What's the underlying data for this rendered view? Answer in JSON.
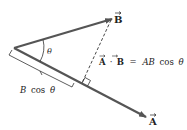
{
  "diagram": {
    "type": "vector-dot-product-projection",
    "vectors": {
      "A": {
        "label": "A",
        "has_arrow_accent": true
      },
      "B": {
        "label": "B",
        "has_arrow_accent": true
      }
    },
    "angle_label": "θ",
    "projection_label": {
      "prefix": "B",
      "func": "cos",
      "angle": "θ"
    },
    "equation": {
      "lhs_a": "A",
      "dot": "·",
      "lhs_b": "B",
      "equals": "=",
      "rhs_ab": "AB",
      "rhs_func": "cos",
      "rhs_angle": "θ"
    },
    "colors": {
      "vector": "#555555",
      "text": "#222222",
      "dashed": "#333333"
    }
  }
}
